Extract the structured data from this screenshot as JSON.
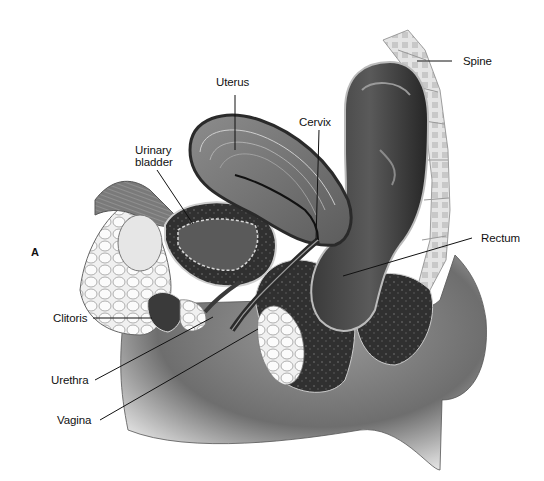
{
  "figure": {
    "panel_letter": "A",
    "labels": [
      {
        "id": "uterus",
        "text": "Uterus"
      },
      {
        "id": "cervix",
        "text": "Cervix"
      },
      {
        "id": "spine",
        "text": "Spine"
      },
      {
        "id": "urinary_bladder",
        "text": "Urinary\nbladder"
      },
      {
        "id": "rectum",
        "text": "Rectum"
      },
      {
        "id": "clitoris",
        "text": "Clitoris"
      },
      {
        "id": "urethra",
        "text": "Urethra"
      },
      {
        "id": "vagina",
        "text": "Vagina"
      }
    ]
  },
  "colors": {
    "background": "#ffffff",
    "label_text": "#111111",
    "leader_line": "#111111",
    "tissue_dark": "#2a2a2a",
    "tissue_mid": "#6b6b6b",
    "tissue_light": "#bdbdbd",
    "fat": "#e8e8e8",
    "skin_shadow": "#8a8a8a"
  }
}
